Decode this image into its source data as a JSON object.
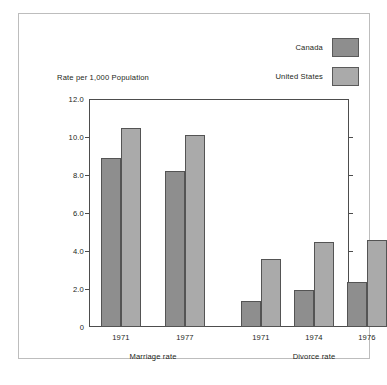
{
  "chart_data": {
    "type": "bar",
    "title": "",
    "subtitle": "",
    "xlabel": "",
    "ylabel": "Rate per 1,000 Population",
    "ylim": [
      0,
      12.0
    ],
    "grid": false,
    "legend_position": "top-right",
    "y_ticks": [
      {
        "value": 12.0,
        "label": "12.0"
      },
      {
        "value": 10.0,
        "label": "10.0"
      },
      {
        "value": 8.0,
        "label": "8.0"
      },
      {
        "value": 6.0,
        "label": "6.0"
      },
      {
        "value": 4.0,
        "label": "4.0"
      },
      {
        "value": 2.0,
        "label": "2.0"
      },
      {
        "value": 0.0,
        "label": "0"
      }
    ],
    "categories": [
      "1971",
      "1977",
      "1971",
      "1974",
      "1976"
    ],
    "groups": [
      {
        "label": "Marriage rate",
        "categories": [
          "1971",
          "1977"
        ]
      },
      {
        "label": "Divorce rate",
        "categories": [
          "1971",
          "1974",
          "1976"
        ]
      }
    ],
    "series": [
      {
        "name": "Canada",
        "color": "#8e8e8e",
        "values": [
          8.9,
          8.2,
          1.35,
          1.95,
          2.35
        ]
      },
      {
        "name": "United States",
        "color": "#aaaaaa",
        "values": [
          10.5,
          10.1,
          3.6,
          4.5,
          4.6
        ]
      }
    ],
    "legend": [
      {
        "label": "Canada",
        "color": "#8e8e8e"
      },
      {
        "label": "United States",
        "color": "#aaaaaa"
      }
    ]
  }
}
